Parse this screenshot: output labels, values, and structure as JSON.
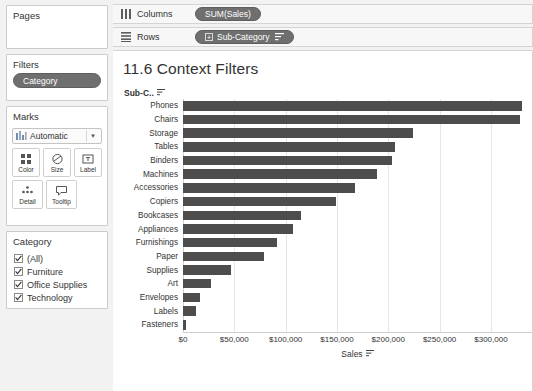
{
  "sidebar": {
    "pages": {
      "title": "Pages"
    },
    "filters": {
      "title": "Filters",
      "pills": [
        {
          "label": "Category",
          "icon": "context-filter-pill"
        }
      ]
    },
    "marks": {
      "title": "Marks",
      "mark_type": "Automatic",
      "mark_type_icon": "bar-mark-icon",
      "buttons": [
        {
          "label": "Color",
          "icon": "color-icon"
        },
        {
          "label": "Size",
          "icon": "size-icon"
        },
        {
          "label": "Label",
          "icon": "label-icon"
        },
        {
          "label": "Detail",
          "icon": "detail-icon"
        },
        {
          "label": "Tooltip",
          "icon": "tooltip-icon"
        }
      ]
    },
    "legend": {
      "title": "Category",
      "items": [
        {
          "label": "(All)",
          "checked": true
        },
        {
          "label": "Furniture",
          "checked": true
        },
        {
          "label": "Office Supplies",
          "checked": true
        },
        {
          "label": "Technology",
          "checked": true
        }
      ]
    }
  },
  "shelves": [
    {
      "name": "Columns",
      "icon": "columns-icon",
      "pills": [
        {
          "label": "SUM(Sales)",
          "expandable": false,
          "sorted": false
        }
      ]
    },
    {
      "name": "Rows",
      "icon": "rows-icon",
      "pills": [
        {
          "label": "Sub-Category",
          "expandable": true,
          "sorted": true
        }
      ]
    }
  ],
  "view": {
    "title": "11.6 Context Filters",
    "row_field_header": "Sub-C..",
    "row_field_sorted": true
  },
  "colors": {
    "bar": "#4d4d4d",
    "pill": "#6f6f6f",
    "context_pill": "#6f6f6f",
    "gridline": "#e6e6e6",
    "app_background": "#f2f2f2",
    "view_background": "#ffffff"
  },
  "chart_data": {
    "type": "bar",
    "orientation": "horizontal",
    "title": "11.6 Context Filters",
    "xlabel": "Sales",
    "ylabel": "Sub-Category",
    "xlim": [
      0,
      340000
    ],
    "xticks": [
      0,
      50000,
      100000,
      150000,
      200000,
      250000,
      300000
    ],
    "xticklabels": [
      "$0",
      "$50,000",
      "$100,000",
      "$150,000",
      "$200,000",
      "$250,000",
      "$300,000"
    ],
    "grid": true,
    "legend": false,
    "sorted": "descending",
    "categories": [
      "Phones",
      "Chairs",
      "Storage",
      "Tables",
      "Binders",
      "Machines",
      "Accessories",
      "Copiers",
      "Bookcases",
      "Appliances",
      "Furnishings",
      "Paper",
      "Supplies",
      "Art",
      "Envelopes",
      "Labels",
      "Fasteners"
    ],
    "values": [
      330007,
      328449,
      223844,
      206966,
      203413,
      189239,
      167380,
      149528,
      114880,
      107532,
      91705,
      78479,
      46674,
      27119,
      16476,
      12486,
      3024
    ],
    "series": [
      {
        "name": "SUM(Sales)",
        "values": [
          330007,
          328449,
          223844,
          206966,
          203413,
          189239,
          167380,
          149528,
          114880,
          107532,
          91705,
          78479,
          46674,
          27119,
          16476,
          12486,
          3024
        ]
      }
    ]
  }
}
